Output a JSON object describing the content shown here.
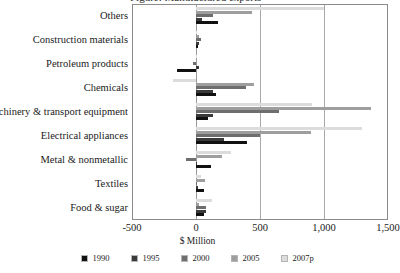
{
  "chart_data": {
    "type": "bar",
    "orientation": "horizontal",
    "title": "Figure: Manufactured exports",
    "xlabel": "$ Million",
    "ylabel": "",
    "xlim": [
      -500,
      1500
    ],
    "xticks": [
      -500,
      0,
      500,
      1000,
      1500
    ],
    "xticklabels": [
      "-500",
      "0",
      "500",
      "1,000",
      "1,500"
    ],
    "grid": true,
    "legend_position": "bottom",
    "categories": [
      "Others",
      "Construction materials",
      "Petroleum products",
      "Chemicals",
      "Machinery & transport equipment",
      "Electrical appliances",
      "Metal & nonmetallic",
      "Textiles",
      "Food & sugar"
    ],
    "series": [
      {
        "name": "1990",
        "color": "#111111",
        "values": [
          170,
          12,
          -150,
          160,
          95,
          400,
          115,
          60,
          60
        ]
      },
      {
        "name": "1995",
        "color": "#3a3a3a",
        "values": [
          45,
          25,
          25,
          135,
          135,
          215,
          10,
          12,
          80
        ]
      },
      {
        "name": "2000",
        "color": "#6e6e6e",
        "values": [
          135,
          40,
          -25,
          390,
          650,
          500,
          -80,
          8,
          80
        ]
      },
      {
        "name": "2005",
        "color": "#9e9e9e",
        "values": [
          440,
          20,
          10,
          455,
          1370,
          900,
          205,
          70,
          25
        ]
      },
      {
        "name": "2007p",
        "color": "#dcdcdc",
        "values": [
          1000,
          8,
          5,
          -180,
          910,
          1300,
          275,
          40,
          125
        ]
      }
    ]
  },
  "legend": {
    "items": [
      {
        "label": "1990",
        "color": "#111111"
      },
      {
        "label": "1995",
        "color": "#3a3a3a"
      },
      {
        "label": "2000",
        "color": "#6e6e6e"
      },
      {
        "label": "2005",
        "color": "#9e9e9e"
      },
      {
        "label": "2007p",
        "color": "#dcdcdc"
      }
    ]
  }
}
